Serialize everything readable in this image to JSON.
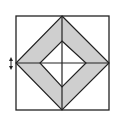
{
  "figure": {
    "colors": {
      "background": "#ffffff",
      "stroke": "#222222",
      "shade": "#cfcfcf",
      "inner": "#ffffff"
    },
    "outer_square": {
      "x1": 16,
      "y1": 16,
      "x2": 109,
      "y2": 110
    },
    "outer_diamond": {
      "top": [
        62,
        16
      ],
      "right": [
        109,
        63
      ],
      "bottom": [
        62,
        110
      ],
      "left": [
        16,
        63
      ]
    },
    "inner_diamond": {
      "top": [
        62,
        41
      ],
      "right": [
        86,
        63
      ],
      "bottom": [
        62,
        87
      ],
      "left": [
        40,
        63
      ]
    },
    "cross": {
      "vertical": [
        [
          62,
          16
        ],
        [
          62,
          110
        ]
      ],
      "horizontal": [
        [
          16,
          63
        ],
        [
          109,
          63
        ]
      ]
    },
    "marker": {
      "type": "double-arrow-vertical",
      "x": 11,
      "y_top": 57,
      "y_bottom": 70
    }
  }
}
